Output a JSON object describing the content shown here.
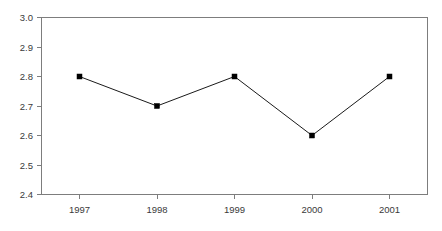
{
  "chart_data": {
    "type": "line",
    "title": "",
    "subtitle": "",
    "xlabel": "",
    "ylabel": "",
    "categories": [
      "1997",
      "1998",
      "1999",
      "2000",
      "2001"
    ],
    "values": [
      2.8,
      2.7,
      2.8,
      2.6,
      2.8
    ],
    "series": [
      {
        "name": "",
        "values": [
          2.8,
          2.7,
          2.8,
          2.6,
          2.8
        ],
        "marker": "square",
        "marker_color": "#000000",
        "line_color": "#1a1a1a"
      }
    ],
    "ylim": [
      2.4,
      3.0
    ],
    "y_ticks": [
      "3.0",
      "2.9",
      "2.8",
      "2.7",
      "2.6",
      "2.5",
      "2.4"
    ],
    "y_tick_values": [
      3.0,
      2.9,
      2.8,
      2.7,
      2.6,
      2.5,
      2.4
    ],
    "x_ticks": [
      "1997",
      "1998",
      "1999",
      "2000",
      "2001"
    ],
    "grid": false,
    "legend": false,
    "legend_position": "none",
    "annotations": [],
    "colors": {
      "axis": "#7d7d7d",
      "line": "#1a1a1a",
      "marker": "#000000",
      "text": "#3a3a3a",
      "background": "#ffffff"
    }
  },
  "y_axis": {
    "labels": [
      {
        "text": "3.0",
        "value": 3.0
      },
      {
        "text": "2.9",
        "value": 2.9
      },
      {
        "text": "2.8",
        "value": 2.8
      },
      {
        "text": "2.7",
        "value": 2.7
      },
      {
        "text": "2.6",
        "value": 2.6
      },
      {
        "text": "2.5",
        "value": 2.5
      },
      {
        "text": "2.4",
        "value": 2.4
      }
    ]
  },
  "x_axis": {
    "labels": [
      {
        "text": "1997"
      },
      {
        "text": "1998"
      },
      {
        "text": "1999"
      },
      {
        "text": "2000"
      },
      {
        "text": "2001"
      }
    ]
  }
}
